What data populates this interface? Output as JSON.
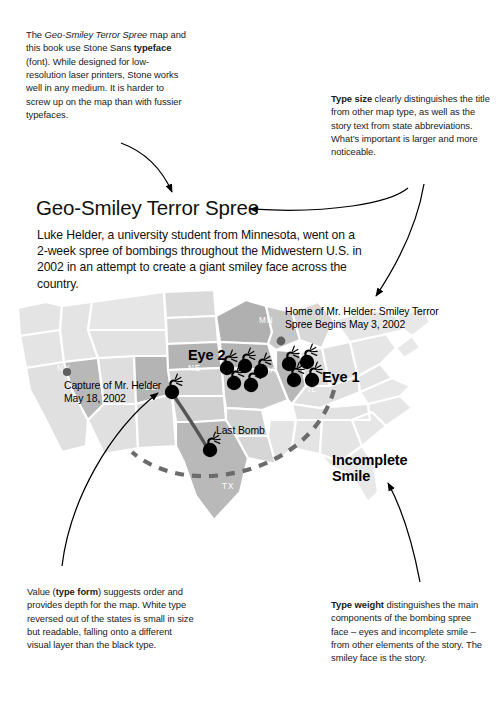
{
  "notes": {
    "typeface": {
      "lead": "The ",
      "italic": "Geo-Smiley Terror Spree",
      "mid": " map and this book use Stone Sans ",
      "bold": "typeface",
      "tail": " (font). While designed for low-resolution laser printers, Stone works well in any medium. It is harder to screw up on the map than with fussier typefaces."
    },
    "typesize": {
      "bold": "Type size",
      "tail": " clearly distinguishes the title from other map type, as well as the story text from state abbreviations. What’s important is larger and more noticeable."
    },
    "typeform": {
      "lead": "Value (",
      "bold": "type form",
      "tail": ") suggests order and provides depth for the map. White type reversed out of the states is small in size but readable, falling onto a different visual layer than the black type."
    },
    "typeweight": {
      "bold": "Type weight",
      "tail": " distinguishes the main components of the bombing spree face – eyes and incomplete smile – from other elements of the story. The smiley face is the story."
    }
  },
  "map": {
    "title": "Geo-Smiley Terror Spree",
    "story": "Luke Helder, a university student from Minnesota, went on a 2-week spree of bombings throughout the Midwestern U.S. in 2002 in an attempt to create a giant smiley face across the country.",
    "labels": {
      "eye1": "Eye 1",
      "eye2": "Eye 2",
      "incomplete_smile": "Incomplete Smile",
      "last_bomb": "Last Bomb",
      "home_callout": "Home of Mr. Helder: Smiley Terror Spree Begins May 3, 2002",
      "capture_callout": "Capture of Mr. Helder May 18, 2002"
    },
    "state_abbreviations": {
      "nv": "NV",
      "co": "CO",
      "ne": "NE",
      "mn": "MN",
      "ia": "IA",
      "il": "IL",
      "tx": "TX"
    },
    "colors": {
      "state_lightest": "#e8e8e8",
      "state_light": "#dcdcdc",
      "state_mid": "#c9c9c9",
      "state_dark": "#b0b0b0",
      "state_darkest": "#9d9d9d",
      "border": "#ffffff",
      "bomb": "#000000",
      "smile_dash": "#6b6b6b",
      "marker_dot": "#5f5f5f",
      "text_black": "#111111",
      "text_white": "#ffffff"
    }
  },
  "icons": {
    "bomb": "bomb-icon",
    "dot": "location-dot-icon",
    "arrow": "curved-arrow-icon"
  }
}
